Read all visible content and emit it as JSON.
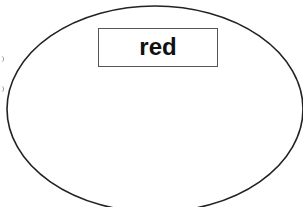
{
  "diagram": {
    "shape": "ellipse",
    "stroke_color": "#222222",
    "fill_color": "#ffffff",
    "label": {
      "text": "red",
      "border_color": "#555555",
      "text_color": "#111111"
    },
    "edge_marks": [
      "partial-glyph",
      "partial-glyph"
    ]
  }
}
